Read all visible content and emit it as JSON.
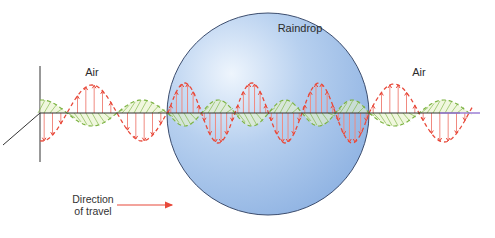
{
  "diagram": {
    "labels": {
      "air_left": "Air",
      "raindrop": "Raindrop",
      "air_right": "Air",
      "direction_line1": "Direction",
      "direction_line2": "of travel"
    },
    "geometry": {
      "axis_y": 113,
      "axis_x_start": 40,
      "axis_x_end": 480,
      "vertical_axis": {
        "x": 40,
        "y1": 66,
        "y2": 162
      },
      "depth_axis": {
        "x1": 40,
        "y1": 113,
        "x2": 3,
        "y2": 145
      },
      "raindrop": {
        "cx": 268,
        "cy": 114,
        "r": 101
      },
      "direction_arrow": {
        "x1": 117,
        "x2": 172,
        "y": 205
      }
    },
    "waves": {
      "segments": [
        {
          "name": "air-left",
          "x_start": 40,
          "x_end": 168,
          "wavelength": 100,
          "phase_origin": 67,
          "amplitude_e": 28,
          "amplitude_b": 13
        },
        {
          "name": "raindrop",
          "x_start": 168,
          "x_end": 369,
          "wavelength": 67,
          "phase_origin": 168,
          "amplitude_e": 30,
          "amplitude_b": 13
        },
        {
          "name": "air-right",
          "x_start": 369,
          "x_end": 472,
          "wavelength": 100,
          "phase_origin": 369,
          "amplitude_e": 29,
          "amplitude_b": 13
        }
      ]
    },
    "colors": {
      "electric_field": "#e8493a",
      "electric_field_light": "#f08a80",
      "magnetic_field": "#7cb342",
      "magnetic_fill": "#e6f2c8",
      "axis": "#333333",
      "axis_end": "#9b7fd4",
      "raindrop_highlight": "#eef5fd",
      "raindrop_mid": "#b7d0ef",
      "raindrop_edge": "#8eb2e2",
      "raindrop_outline": "#3c4d6e",
      "arrow": "#e8493a"
    }
  }
}
